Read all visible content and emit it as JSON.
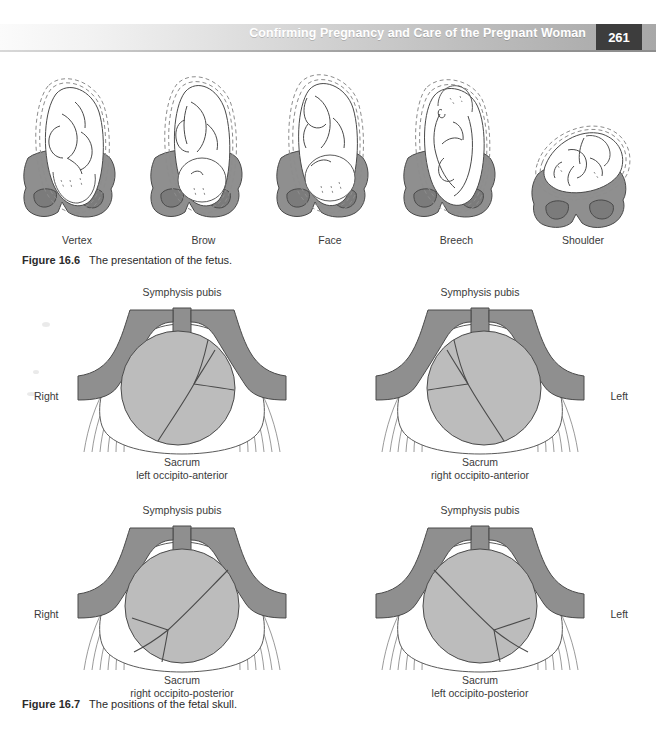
{
  "header": {
    "title": "Confirming Pregnancy and Care of the Pregnant Woman",
    "page_number": "261"
  },
  "figure_16_6": {
    "number": "Figure 16.6",
    "caption": "The presentation of the fetus.",
    "items": [
      {
        "label": "Vertex"
      },
      {
        "label": "Brow"
      },
      {
        "label": "Face"
      },
      {
        "label": "Breech"
      },
      {
        "label": "Shoulder"
      }
    ]
  },
  "figure_16_7": {
    "number": "Figure 16.7",
    "caption": "The positions of the fetal skull.",
    "diagrams": [
      {
        "top_label": "Symphysis pubis",
        "side_label": "Right",
        "side": "left",
        "bottom_label_1": "Sacrum",
        "bottom_label_2": "left occipito-anterior"
      },
      {
        "top_label": "Symphysis pubis",
        "side_label": "Left",
        "side": "right",
        "bottom_label_1": "Sacrum",
        "bottom_label_2": "right occipito-anterior"
      },
      {
        "top_label": "Symphysis pubis",
        "side_label": "Right",
        "side": "left",
        "bottom_label_1": "Sacrum",
        "bottom_label_2": "right occipito-posterior"
      },
      {
        "top_label": "Symphysis pubis",
        "side_label": "Left",
        "side": "right",
        "bottom_label_1": "Sacrum",
        "bottom_label_2": "left occipito-posterior"
      }
    ]
  },
  "colors": {
    "pelvis_gray": "#8f8f8f",
    "skull_gray": "#bcbcbc",
    "line": "#3a3a3a",
    "header_accent": "#3d3d3d",
    "page_background": "#ffffff"
  }
}
